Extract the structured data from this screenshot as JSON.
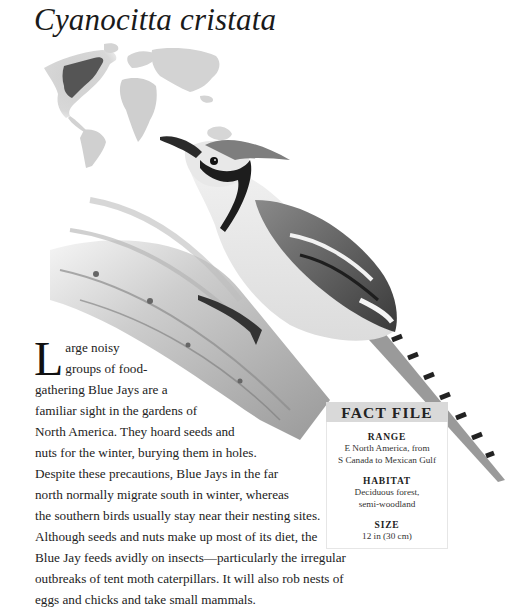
{
  "page": {
    "title": "Cyanocitta cristata"
  },
  "map": {
    "label": "range-map",
    "highlight_region": "Eastern North America",
    "land_color": "#cfcfcf",
    "highlight_color": "#555555"
  },
  "illustration": {
    "subject": "Blue Jay perched on a palm frond"
  },
  "article": {
    "dropcap": "L",
    "lines": [
      "arge noisy",
      "groups of food-",
      "gathering Blue Jays are a",
      "familiar sight in the gardens of",
      "North America. They hoard seeds and",
      "nuts for the winter, burying them in holes.",
      "Despite these precautions, Blue Jays in the far",
      "north normally migrate south in winter, whereas",
      "the southern birds usually stay near their nesting sites.",
      "Although seeds and nuts make up most of its diet, the",
      "Blue Jay feeds avidly on insects—particularly the irregular",
      "outbreaks of tent moth caterpillars. It will also rob nests of",
      "eggs and chicks and take small mammals."
    ]
  },
  "fact_file": {
    "header": "FACT FILE",
    "sections": [
      {
        "label": "RANGE",
        "value_lines": [
          "E North America, from",
          "S Canada to Mexican Gulf"
        ]
      },
      {
        "label": "HABITAT",
        "value_lines": [
          "Deciduous forest,",
          "semi-woodland"
        ]
      },
      {
        "label": "SIZE",
        "value_lines": [
          "12 in (30 cm)"
        ]
      }
    ]
  }
}
